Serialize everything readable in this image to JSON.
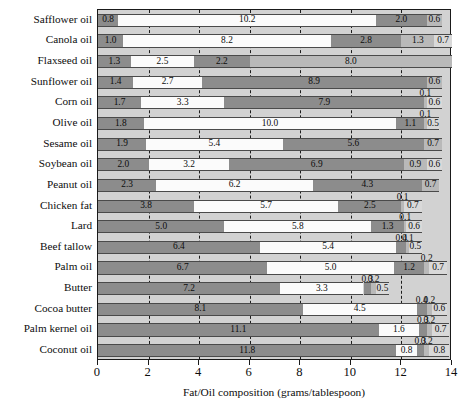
{
  "chart_data": {
    "type": "bar",
    "subtype": "stacked-horizontal",
    "title": "",
    "xlabel": "Fat/Oil composition (grams/tablespoon)",
    "ylabel": "",
    "xlim": [
      0,
      14
    ],
    "xticks": [
      0,
      2,
      4,
      6,
      8,
      10,
      12,
      14
    ],
    "grid": true,
    "legend": "none",
    "categories": [
      "Safflower oil",
      "Canola oil",
      "Flaxseed oil",
      "Sunflower oil",
      "Corn oil",
      "Olive oil",
      "Sesame oil",
      "Soybean oil",
      "Peanut oil",
      "Chicken fat",
      "Lard",
      "Beef tallow",
      "Palm oil",
      "Butter",
      "Cocoa butter",
      "Palm kernel oil",
      "Coconut oil"
    ],
    "rows": [
      {
        "category": "Safflower oil",
        "values": [
          0.8,
          10.2,
          2.0,
          0.6
        ]
      },
      {
        "category": "Canola oil",
        "values": [
          1.0,
          8.2,
          2.8,
          1.3,
          0.7
        ]
      },
      {
        "category": "Flaxseed oil",
        "values": [
          1.3,
          2.5,
          2.2,
          8.0
        ]
      },
      {
        "category": "Sunflower oil",
        "values": [
          1.4,
          2.7,
          8.9,
          0.6
        ]
      },
      {
        "category": "Corn oil",
        "values": [
          1.7,
          3.3,
          7.9,
          0.1,
          0.6
        ]
      },
      {
        "category": "Olive oil",
        "values": [
          1.8,
          10.0,
          1.1,
          0.1,
          0.5
        ]
      },
      {
        "category": "Sesame oil",
        "values": [
          1.9,
          5.4,
          5.6,
          0.7
        ]
      },
      {
        "category": "Soybean oil",
        "values": [
          2.0,
          3.2,
          6.9,
          0.9,
          0.6
        ]
      },
      {
        "category": "Peanut oil",
        "values": [
          2.3,
          6.2,
          4.3,
          0.7
        ]
      },
      {
        "category": "Chicken fat",
        "values": [
          3.8,
          5.7,
          2.5,
          0.1,
          0.7
        ]
      },
      {
        "category": "Lard",
        "values": [
          5.0,
          5.8,
          1.3,
          0.1,
          0.6
        ]
      },
      {
        "category": "Beef tallow",
        "values": [
          6.4,
          5.4,
          0.4,
          0.1,
          0.5
        ]
      },
      {
        "category": "Palm oil",
        "values": [
          6.7,
          5.0,
          1.2,
          0.2,
          0.7
        ]
      },
      {
        "category": "Butter",
        "values": [
          7.2,
          3.3,
          0.3,
          0.2,
          0.5
        ]
      },
      {
        "category": "Cocoa butter",
        "values": [
          8.1,
          4.5,
          0.4,
          0.2,
          0.6
        ]
      },
      {
        "category": "Palm kernel oil",
        "values": [
          11.1,
          1.6,
          0.3,
          0.2,
          0.7
        ]
      },
      {
        "category": "Coconut oil",
        "values": [
          11.8,
          0.8,
          0.3,
          0.2,
          0.8
        ]
      }
    ],
    "value_labels": [
      [
        "0.8",
        "10.2",
        "2.0",
        "0.6"
      ],
      [
        "1.0",
        "8.2",
        "2.8",
        "1.3",
        "0.7"
      ],
      [
        "1.3",
        "2.5",
        "2.2",
        "8.0"
      ],
      [
        "1.4",
        "2.7",
        "8.9",
        "0.6"
      ],
      [
        "1.7",
        "3.3",
        "7.9",
        "0.1",
        "0.6"
      ],
      [
        "1.8",
        "10.0",
        "1.1",
        "0.1",
        "0.5"
      ],
      [
        "1.9",
        "5.4",
        "5.6",
        "0.7"
      ],
      [
        "2.0",
        "3.2",
        "6.9",
        "0.9",
        "0.6"
      ],
      [
        "2.3",
        "6.2",
        "4.3",
        "0.7"
      ],
      [
        "3.8",
        "5.7",
        "2.5",
        "0.1",
        "0.7"
      ],
      [
        "5.0",
        "5.8",
        "1.3",
        "0.1",
        "0.6"
      ],
      [
        "6.4",
        "5.4",
        "0.4",
        "0.1",
        "0.5"
      ],
      [
        "6.7",
        "5.0",
        "1.2",
        "0.2",
        "0.7"
      ],
      [
        "7.2",
        "3.3",
        "0.3",
        "0.2",
        "0.5"
      ],
      [
        "8.1",
        "4.5",
        "0.4",
        "0.2",
        "0.6"
      ],
      [
        "11.1",
        "1.6",
        "0.3",
        "0.2",
        "0.7"
      ],
      [
        "11.8",
        "0.8",
        "0.3",
        "0.2",
        "0.8"
      ]
    ]
  },
  "colors": {
    "plot_background": "#d2d2d2",
    "segment_1": "#8c8c8c",
    "segment_2": "#fbfbfb",
    "segment_3": "#8c8c8c",
    "segment_4": "#b9b9b9",
    "segment_5": "#d9d9d9",
    "axis": "#1a1a1a",
    "text": "#0d0d0d"
  }
}
